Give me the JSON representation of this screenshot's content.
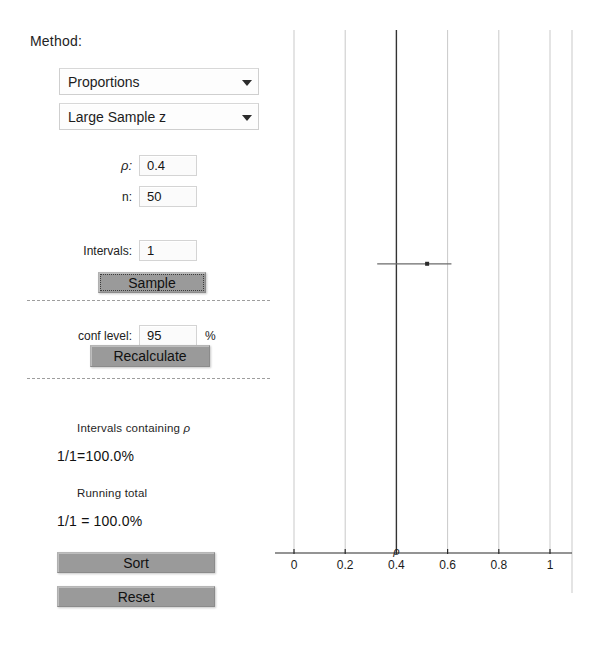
{
  "panel": {
    "method_label": "Method:",
    "selects": [
      {
        "name": "method",
        "value": "Proportions"
      },
      {
        "name": "procedure",
        "value": "Large Sample z"
      }
    ],
    "fields": [
      {
        "name": "p",
        "label": "ρ:",
        "value": "0.4",
        "suffix": ""
      },
      {
        "name": "n",
        "label": "n:",
        "value": "50",
        "suffix": ""
      },
      {
        "name": "intervals",
        "label": "Intervals:",
        "value": "1",
        "suffix": ""
      },
      {
        "name": "conf-level",
        "label": "conf level:",
        "value": "95",
        "suffix": "%"
      }
    ],
    "buttons": {
      "sample": "Sample",
      "recalculate": "Recalculate",
      "sort": "Sort",
      "reset": "Reset"
    },
    "results": {
      "containing_label_pre": "Intervals containing ",
      "containing_label_rho": "ρ",
      "containing_value": "1/1=100.0%",
      "running_label": "Running total",
      "running_value": "1/1 = 100.0%"
    }
  },
  "chart_data": {
    "type": "line",
    "title": "",
    "xlabel": "",
    "ylabel": "",
    "xlim": [
      0,
      1.12
    ],
    "ylim": [
      0,
      1
    ],
    "grid": true,
    "legend": null,
    "tick_labels": [
      "0",
      "0.2",
      "0.4",
      "0.6",
      "0.8",
      "1"
    ],
    "tick_values": [
      0,
      0.2,
      0.4,
      0.6,
      0.8,
      1
    ],
    "true_parameter": {
      "symbol": "ρ",
      "value": 0.4,
      "color": "#333333"
    },
    "gridline_color": "#c9c9c9",
    "interval_color": "#6b6b6b",
    "intervals": [
      {
        "index": 1,
        "estimate": 0.52,
        "lower": 0.325,
        "upper": 0.615,
        "y": 0.553,
        "contains_parameter": true
      }
    ]
  }
}
